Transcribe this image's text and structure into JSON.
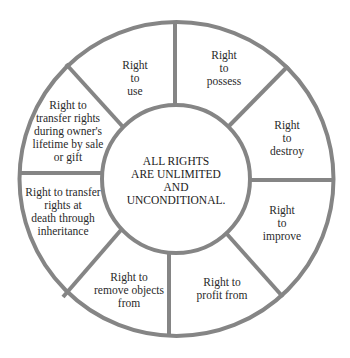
{
  "diagram": {
    "center": {
      "text": "ALL RIGHTS\nARE UNLIMITED\nAND\nUNCONDITIONAL."
    },
    "segments": [
      {
        "id": "use",
        "text": "Right\nto\nuse"
      },
      {
        "id": "possess",
        "text": "Right\nto\npossess"
      },
      {
        "id": "destroy",
        "text": "Right\nto\ndestroy"
      },
      {
        "id": "improve",
        "text": "Right\nto\nimprove"
      },
      {
        "id": "profit",
        "text": "Right to\nprofit from"
      },
      {
        "id": "remove",
        "text": "Right to\nremove objects\nfrom"
      },
      {
        "id": "inheritance",
        "text": "Right to transfer\nrights at\ndeath through\ninheritance"
      },
      {
        "id": "sale-gift",
        "text": "Right to\ntransfer rights\nduring owner's\nlifetime by sale\nor gift"
      }
    ],
    "colors": {
      "stroke": "#858585",
      "background": "#ffffff",
      "text": "#2a2a2a"
    }
  }
}
